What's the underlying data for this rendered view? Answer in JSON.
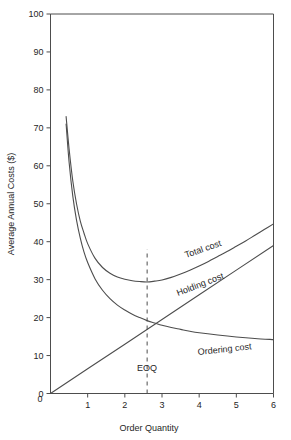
{
  "chart_data": {
    "type": "line",
    "title": "",
    "xlabel": "Order Quantity",
    "ylabel": "Average Annual Costs ($)",
    "xlim": [
      0,
      6
    ],
    "ylim": [
      0,
      100
    ],
    "xticks": [
      "0",
      "1",
      "2",
      "3",
      "4",
      "5",
      "6"
    ],
    "xtick_values": [
      0,
      1,
      2,
      3,
      4,
      5,
      6
    ],
    "yticks": [
      "0",
      "10",
      "20",
      "30",
      "40",
      "50",
      "60",
      "70",
      "80",
      "90",
      "100"
    ],
    "ytick_values": [
      0,
      10,
      20,
      30,
      40,
      50,
      60,
      70,
      80,
      90,
      100
    ],
    "grid": false,
    "legend_position": "inline-curve-labels",
    "series": [
      {
        "name": "Total cost",
        "label": "Total cost",
        "x": [
          0.42,
          0.5,
          0.6,
          0.7,
          0.8,
          0.9,
          1.0,
          1.2,
          1.4,
          1.6,
          1.8,
          2.0,
          2.2,
          2.4,
          2.6,
          2.8,
          3.0,
          3.25,
          3.5,
          3.75,
          4.0,
          4.25,
          4.5,
          4.75,
          5.0,
          5.25,
          5.5,
          5.75,
          6.0
        ],
        "y": [
          73.0,
          64.5,
          56.0,
          50.0,
          45.5,
          42.3,
          39.5,
          35.6,
          33.2,
          31.7,
          30.7,
          30.1,
          29.7,
          29.5,
          29.4,
          29.6,
          29.9,
          30.6,
          31.5,
          32.5,
          33.6,
          34.8,
          36.1,
          37.4,
          38.8,
          40.2,
          41.7,
          43.2,
          44.7
        ]
      },
      {
        "name": "Holding cost",
        "label": "Holding cost",
        "x": [
          0,
          1,
          2,
          3,
          4,
          5,
          6
        ],
        "y": [
          0.0,
          6.5,
          13.0,
          19.5,
          26.0,
          32.5,
          39.0
        ]
      },
      {
        "name": "Ordering cost",
        "label": "Ordering cost",
        "x": [
          0.42,
          0.5,
          0.6,
          0.7,
          0.8,
          0.9,
          1.0,
          1.2,
          1.4,
          1.6,
          1.8,
          2.0,
          2.2,
          2.4,
          2.6,
          2.8,
          3.0,
          3.25,
          3.5,
          3.75,
          4.0,
          4.5,
          5.0,
          5.5,
          6.0
        ],
        "y": [
          71.0,
          61.0,
          52.0,
          45.7,
          41.0,
          37.3,
          34.5,
          30.2,
          27.2,
          25.0,
          23.3,
          22.0,
          20.9,
          20.0,
          19.2,
          18.6,
          18.0,
          17.4,
          16.9,
          16.4,
          16.0,
          15.4,
          14.9,
          14.5,
          14.2
        ]
      }
    ],
    "annotations": [
      {
        "text": "EOQ",
        "x": 2.6,
        "y": 6.0,
        "kind": "eoq-label"
      }
    ],
    "reference_lines": [
      {
        "name": "eoq-dashed-line",
        "orientation": "vertical",
        "x": 2.6,
        "y_from": 0,
        "y_to": 38,
        "style": "dashed"
      }
    ],
    "colors": {
      "line": "#4d4d4d",
      "text": "#262626",
      "background": "#ffffff"
    }
  }
}
